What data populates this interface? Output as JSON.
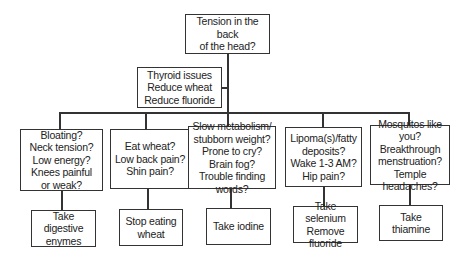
{
  "diagram": {
    "root": {
      "text": "Tension in the back\nof the head?"
    },
    "side_note": {
      "text": "Thyroid issues\nReduce wheat\nReduce fluoride"
    },
    "branches": [
      {
        "question": "Bloating?\nNeck tension?\nLow energy?\nKnees painful\nor weak?",
        "action": "Take digestive\nenymes"
      },
      {
        "question": "Eat wheat?\nLow back pain?\nShin pain?",
        "action": "Stop eating\nwheat"
      },
      {
        "question": "Slow metabolism/\nstubborn weight?\nProne to cry?\nBrain fog?\nTrouble finding words?",
        "action": "Take iodine"
      },
      {
        "question": "Lipoma(s)/fatty\ndeposits?\nWake 1-3 AM?\nHip pain?",
        "action": "Take selenium\nRemove fluoride"
      },
      {
        "question": "Mosquitos  like you?\nBreakthrough\nmenstruation?\nTemple headaches?",
        "action": "Take thiamine"
      }
    ]
  }
}
